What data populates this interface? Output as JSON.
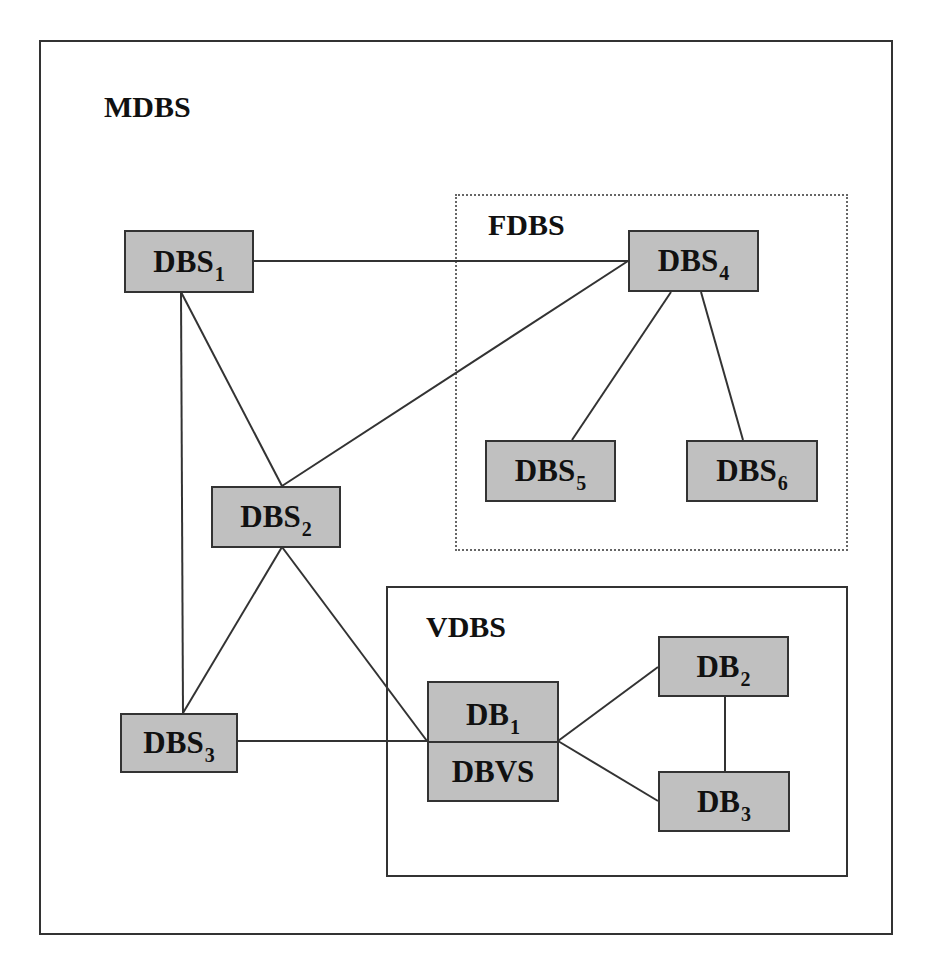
{
  "diagram": {
    "groups": [
      {
        "id": "mdbs",
        "label": "MDBS",
        "border": "solid"
      },
      {
        "id": "fdbs",
        "label": "FDBS",
        "border": "dotted"
      },
      {
        "id": "vdbs",
        "label": "VDBS",
        "border": "solid"
      }
    ],
    "nodes": [
      {
        "id": "dbs1",
        "base": "DBS",
        "sub": "1",
        "group": "mdbs"
      },
      {
        "id": "dbs2",
        "base": "DBS",
        "sub": "2",
        "group": "mdbs"
      },
      {
        "id": "dbs3",
        "base": "DBS",
        "sub": "3",
        "group": "mdbs"
      },
      {
        "id": "dbs4",
        "base": "DBS",
        "sub": "4",
        "group": "fdbs"
      },
      {
        "id": "dbs5",
        "base": "DBS",
        "sub": "5",
        "group": "fdbs"
      },
      {
        "id": "dbs6",
        "base": "DBS",
        "sub": "6",
        "group": "fdbs"
      },
      {
        "id": "db1",
        "base": "DB",
        "sub": "1",
        "group": "vdbs"
      },
      {
        "id": "dbvs",
        "base": "DBVS",
        "sub": "",
        "group": "vdbs"
      },
      {
        "id": "db2",
        "base": "DB",
        "sub": "2",
        "group": "vdbs"
      },
      {
        "id": "db3",
        "base": "DB",
        "sub": "3",
        "group": "vdbs"
      }
    ],
    "edges": [
      [
        "dbs1",
        "dbs4"
      ],
      [
        "dbs1",
        "dbs2"
      ],
      [
        "dbs1",
        "dbs3"
      ],
      [
        "dbs2",
        "dbs4"
      ],
      [
        "dbs2",
        "dbs3"
      ],
      [
        "dbs2",
        "db1"
      ],
      [
        "dbs3",
        "db1"
      ],
      [
        "dbs4",
        "dbs5"
      ],
      [
        "dbs4",
        "dbs6"
      ],
      [
        "db1",
        "db2"
      ],
      [
        "db1",
        "db3"
      ],
      [
        "db2",
        "db3"
      ]
    ],
    "colors": {
      "node_fill": "#c0c0c0",
      "stroke": "#333333"
    }
  }
}
